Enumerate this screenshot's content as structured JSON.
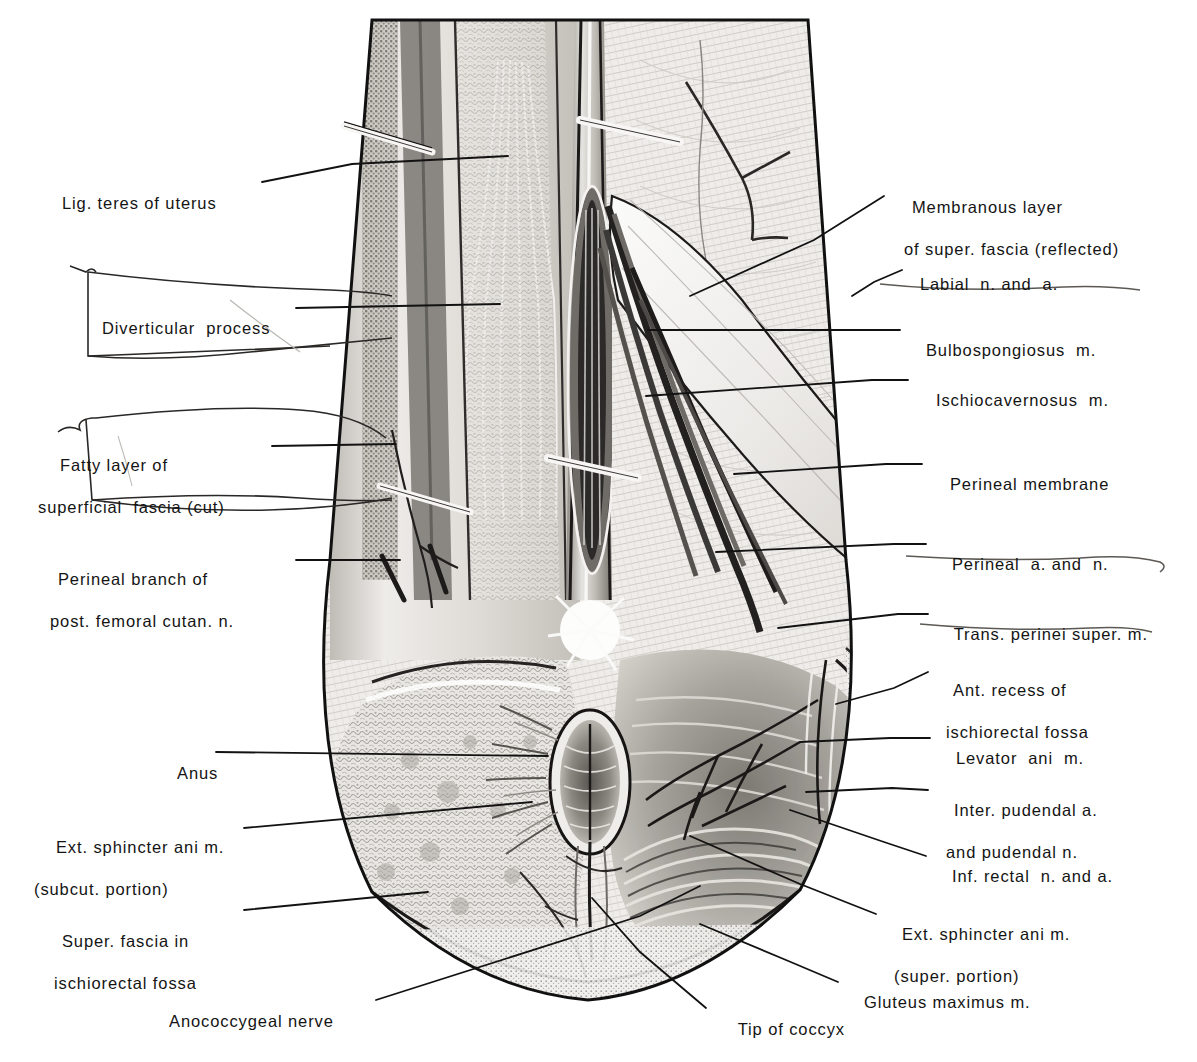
{
  "figure": {
    "type": "anatomical-illustration",
    "line_color": "#121212",
    "ink_color": "#141414",
    "paper_color": "#ffffff"
  },
  "labels_left": [
    {
      "id": "lig-teres-of-uterus",
      "line1": "Lig. teres of uterus",
      "line2": ""
    },
    {
      "id": "diverticular-process",
      "line1": "Diverticular  process",
      "line2": ""
    },
    {
      "id": "fatty-layer-of-superficial-fascia",
      "line1": "Fatty layer of",
      "line2": "superficial  fascia (cut)"
    },
    {
      "id": "perineal-branch-of-post-femoral-cutan-n",
      "line1": "Perineal branch of",
      "line2": "post. femoral cutan. n."
    },
    {
      "id": "anus",
      "line1": "Anus",
      "line2": ""
    },
    {
      "id": "ext-sphincter-ani-m-subcut-portion",
      "line1": "Ext. sphincter ani m.",
      "line2": "(subcut. portion)"
    },
    {
      "id": "super-fascia-in-ischiorectal-fossa",
      "line1": "Super. fascia in",
      "line2": "ischiorectal fossa"
    }
  ],
  "labels_right": [
    {
      "id": "membranous-layer-of-super-fascia-reflected",
      "line1": "Membranous layer",
      "line2": "of super. fascia (reflected)"
    },
    {
      "id": "labial-n-and-a",
      "line1": "Labial  n. and  a.",
      "line2": ""
    },
    {
      "id": "bulbospongiosus-m",
      "line1": "Bulbospongiosus  m.",
      "line2": ""
    },
    {
      "id": "ischiocavernosus-m",
      "line1": "Ischiocavernosus  m.",
      "line2": ""
    },
    {
      "id": "perineal-membrane",
      "line1": "Perineal membrane",
      "line2": ""
    },
    {
      "id": "perineal-a-and-n",
      "line1": "Perineal  a. and  n.",
      "line2": ""
    },
    {
      "id": "trans-perinei-super-m",
      "line1": "Trans. perinei super. m.",
      "line2": ""
    },
    {
      "id": "ant-recess-of-ischiorectal-fossa",
      "line1": "Ant. recess of",
      "line2": "ischiorectal fossa"
    },
    {
      "id": "levator-ani-m",
      "line1": "Levator  ani  m.",
      "line2": ""
    },
    {
      "id": "inter-pudendal-a-and-pudendal-n",
      "line1": "Inter. pudendal a.",
      "line2": "and pudendal n."
    },
    {
      "id": "inf-rectal-n-and-a",
      "line1": "Inf. rectal  n. and a.",
      "line2": ""
    },
    {
      "id": "ext-sphincter-ani-m-super-portion",
      "line1": "Ext. sphincter ani m.",
      "line2": "(super. portion)"
    },
    {
      "id": "gluteus-maximus-m",
      "line1": "Gluteus maximus m.",
      "line2": ""
    }
  ],
  "labels_bottom": [
    {
      "id": "anococcygeal-nerve",
      "line1": "Anococcygeal nerve",
      "line2": ""
    },
    {
      "id": "tip-of-coccyx",
      "line1": "Tip of coccyx",
      "line2": ""
    }
  ]
}
